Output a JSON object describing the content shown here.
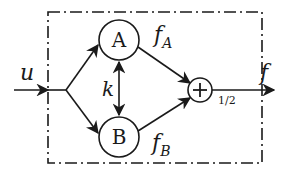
{
  "diagram": {
    "type": "block-diagram",
    "colors": {
      "stroke": "#1a1a1a",
      "background": "#ffffff"
    },
    "boundary": {
      "style": "dash-dot",
      "x": 48,
      "y": 12,
      "width": 214,
      "height": 151
    },
    "input": {
      "label": "u"
    },
    "output": {
      "label": "f"
    },
    "blocks": [
      {
        "id": "A",
        "label": "A",
        "cx": 119,
        "cy": 40,
        "r": 20
      },
      {
        "id": "B",
        "label": "B",
        "cx": 119,
        "cy": 137,
        "r": 20
      }
    ],
    "adder": {
      "symbol": "+",
      "gain_label": "1/2",
      "cx": 200,
      "cy": 90,
      "r": 12
    },
    "coupling": {
      "label": "k",
      "direction": "bidirectional"
    },
    "signals": {
      "fA": {
        "main": "f",
        "sub": "A"
      },
      "fB": {
        "main": "f",
        "sub": "B"
      }
    }
  }
}
